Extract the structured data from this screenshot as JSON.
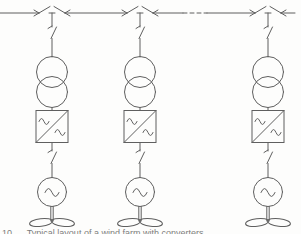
{
  "diagram": {
    "type": "single-line-diagram",
    "caption": "10      Typical layout of a wind farm with converters",
    "colors": {
      "line": "#5f5f5f",
      "background": "#fdfdfc",
      "caption": "#7d7d7d"
    },
    "bus": {
      "y": 13,
      "x_start": 0,
      "x_end": 295,
      "junctions_x": [
        52,
        140,
        268
      ],
      "dashed_segment": [
        183,
        207
      ],
      "dash_pattern": "4 3"
    },
    "branches": [
      {
        "name": "turbine-string-1",
        "x": 52,
        "components": [
          "disconnector",
          "two-winding-transformer",
          "ac-ac-converter",
          "disconnector",
          "ac-generator",
          "turbine-rotor"
        ]
      },
      {
        "name": "turbine-string-2",
        "x": 140,
        "components": [
          "disconnector",
          "two-winding-transformer",
          "ac-ac-converter",
          "disconnector",
          "ac-generator",
          "turbine-rotor"
        ]
      },
      {
        "name": "turbine-string-3",
        "x": 268,
        "components": [
          "disconnector",
          "two-winding-transformer",
          "ac-ac-converter",
          "disconnector",
          "ac-generator",
          "turbine-rotor"
        ]
      }
    ]
  }
}
